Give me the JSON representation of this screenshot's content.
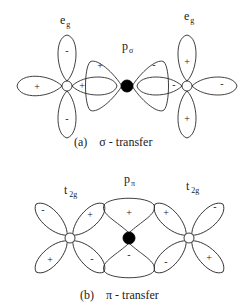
{
  "panel_a": {
    "caption_letter": "(a)",
    "caption_text": "σ - transfer",
    "left_orbital": {
      "label_main": "e",
      "label_sub": "g",
      "signs": {
        "left": "+",
        "right": "+",
        "top": "-",
        "bottom": "-"
      }
    },
    "center_orbital": {
      "label_main": "p",
      "label_sub": "σ",
      "signs": {
        "left": "+",
        "right": "-"
      }
    },
    "right_orbital": {
      "label_main": "e",
      "label_sub": "g",
      "signs": {
        "left": "-",
        "right": "-",
        "top": "+",
        "bottom": "+"
      }
    }
  },
  "panel_b": {
    "caption_letter": "(b)",
    "caption_text": "π - transfer",
    "left_orbital": {
      "label_main": "t",
      "label_sub": "2g",
      "signs": {
        "upper_left": "-",
        "upper_right": "+",
        "lower_left": "+",
        "lower_right": "-"
      }
    },
    "center_orbital": {
      "label_main": "p",
      "label_sub": "π",
      "signs": {
        "top": "+",
        "bottom": "-"
      }
    },
    "right_orbital": {
      "label_main": "t",
      "label_sub": "2g",
      "signs": {
        "upper_left": "+",
        "upper_right": "-",
        "lower_left": "-",
        "lower_right": "+"
      }
    }
  }
}
